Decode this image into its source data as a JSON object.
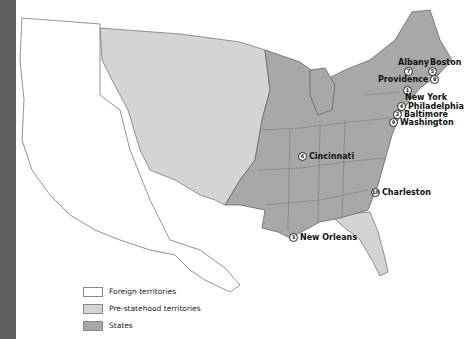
{
  "map": {
    "colors": {
      "foreign": "#ffffff",
      "pre_statehood": "#d4d4d4",
      "states": "#a8a8a8",
      "border": "#777777",
      "sidebar": "#5e5e5e"
    },
    "cities": [
      {
        "name": "Albany",
        "rank": "7"
      },
      {
        "name": "Boston",
        "rank": "5"
      },
      {
        "name": "Providence",
        "rank": "8"
      },
      {
        "name": "New York",
        "rank": "1"
      },
      {
        "name": "Philadelphia",
        "rank": "4"
      },
      {
        "name": "Baltimore",
        "rank": "2"
      },
      {
        "name": "Washington",
        "rank": "9"
      },
      {
        "name": "Cincinnati",
        "rank": "6"
      },
      {
        "name": "Charleston",
        "rank": "10"
      },
      {
        "name": "New Orleans",
        "rank": "3"
      }
    ]
  },
  "legend": {
    "items": [
      {
        "label": "Foreign territories",
        "color": "#ffffff"
      },
      {
        "label": "Pre-statehood territories",
        "color": "#d4d4d4"
      },
      {
        "label": "States",
        "color": "#a8a8a8"
      }
    ]
  }
}
